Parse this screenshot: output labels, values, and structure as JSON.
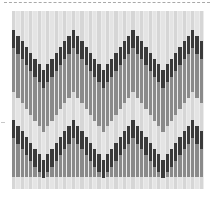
{
  "image": {
    "description": "Bargello flame-stitch needlepoint swatch: vertical stitch columns forming two rows of grayscale zigzag chevrons",
    "colors": {
      "background": "#ffffff",
      "light": "#d6d6d6",
      "light_stitch": "#e4e4e4",
      "medium": "#8a8a8a",
      "dark": "#3a3a3a",
      "gap": "#ececec",
      "dash_rule": "#a9a9a9"
    },
    "grid": {
      "left": 12,
      "top": 11,
      "width": 192,
      "height": 178,
      "columns": 45,
      "period_columns": 14,
      "dark_segment_height": 18,
      "band_offset": 90
    },
    "peaks_x": [
      13,
      72,
      133,
      192
    ],
    "valleys_x": [
      42,
      102,
      163
    ],
    "top_band": {
      "peak_y": 30,
      "valley_y": 70
    },
    "bottom_band": {
      "peak_y": 120,
      "valley_y": 160
    }
  }
}
